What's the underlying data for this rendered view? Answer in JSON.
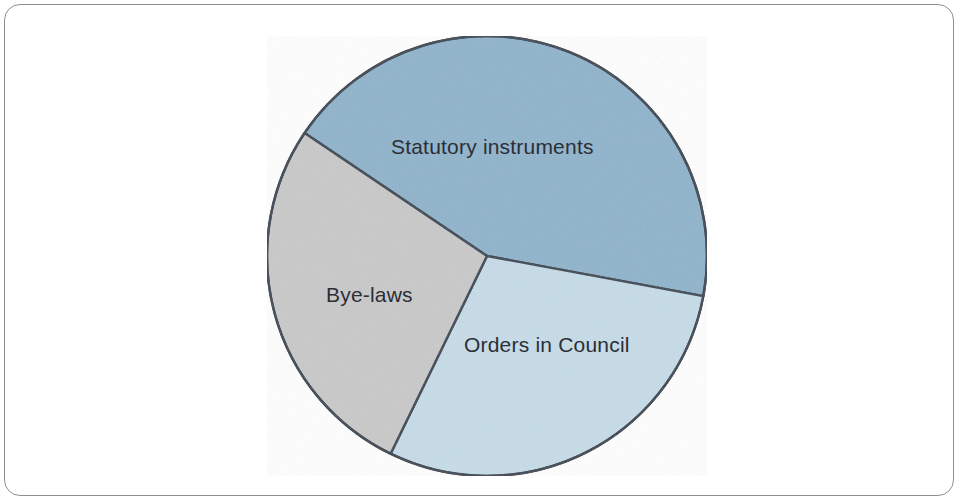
{
  "figure": {
    "border_color": "#8e9094",
    "background": "#ffffff"
  },
  "chart_data": {
    "type": "pie",
    "title": "",
    "subtitle": "",
    "xlabel": "",
    "ylabel": "",
    "grid": false,
    "legend_position": "none",
    "labels_placement": "inside-slices",
    "start_angle_deg": 304,
    "direction": "clockwise",
    "center": {
      "x": 487,
      "y": 256
    },
    "radius": 220,
    "outline_color": "#3a4450",
    "categories": [
      "Statutory instruments",
      "Orders in Council",
      "Bye-laws"
    ],
    "values": [
      43.5,
      29.3,
      27.2
    ],
    "angles_deg": [
      156.5,
      105.5,
      98.0
    ],
    "colors": [
      "#8FB4CC",
      "#C6DCE8",
      "#C9C9C9"
    ],
    "slices": [
      {
        "label": "Statutory instruments",
        "value": 43.5,
        "angle_deg": 156.5,
        "color": "#8FB4CC",
        "start_deg": 304,
        "end_deg": 100.5
      },
      {
        "label": "Orders in Council",
        "value": 29.3,
        "angle_deg": 105.5,
        "color": "#C6DCE8",
        "start_deg": 100.5,
        "end_deg": 206
      },
      {
        "label": "Bye-laws",
        "value": 27.2,
        "angle_deg": 98.0,
        "color": "#C9C9C9",
        "start_deg": 206,
        "end_deg": 304
      }
    ]
  }
}
